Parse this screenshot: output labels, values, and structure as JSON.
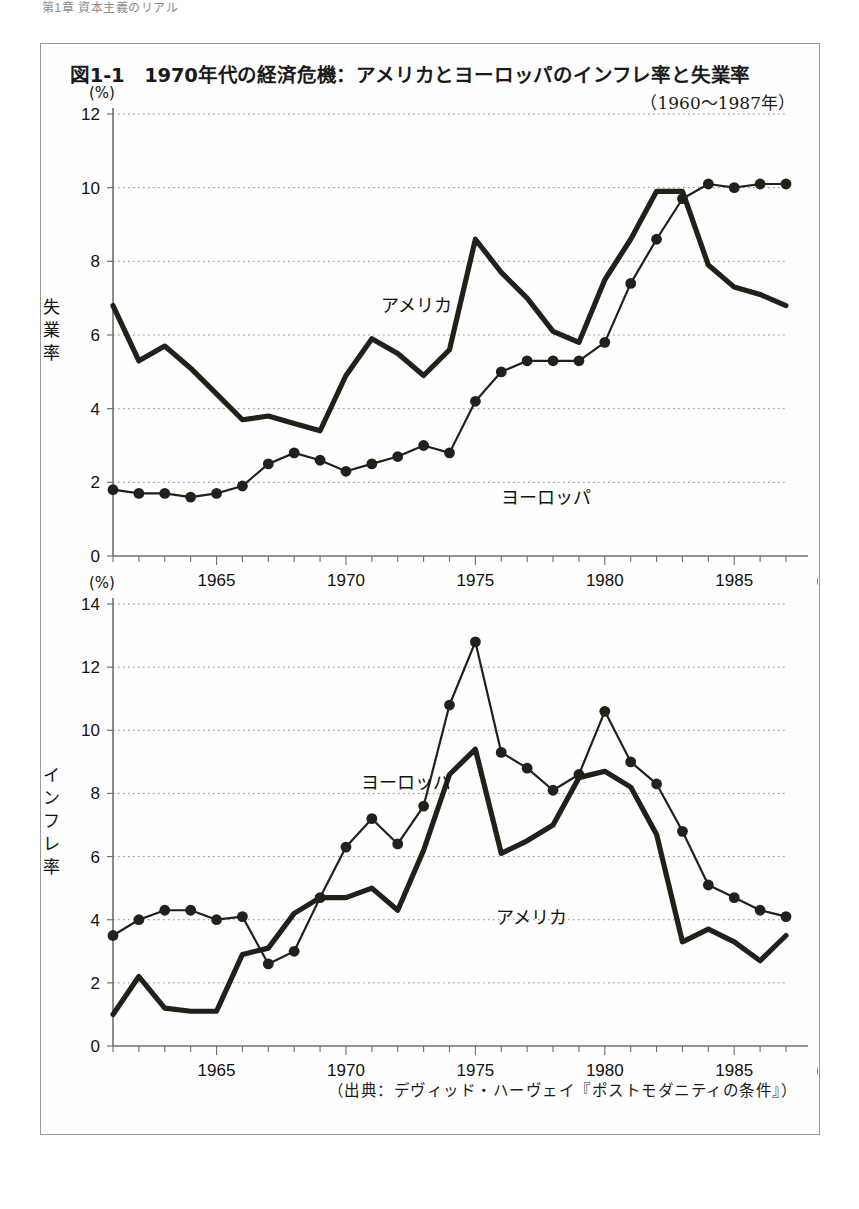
{
  "page": {
    "header_text": "第1章 資本主義のリアル"
  },
  "figure": {
    "title": "図1-1　1970年代の経済危機：アメリカとヨーロッパのインフレ率と失業率",
    "subtitle": "（1960〜1987年）",
    "source": "（出典：デヴィッド・ハーヴェイ『ポストモダニティの条件』）",
    "unit_label": "(%)",
    "year_unit_label": "(年)",
    "series_label_america": "アメリカ",
    "series_label_europe": "ヨーロッパ"
  },
  "chart_data": [
    {
      "type": "line",
      "title": "失業率",
      "ylabel": "失業率",
      "xlabel": "(年)",
      "unit": "(%)",
      "ylim": [
        0,
        12
      ],
      "yticks": [
        0,
        2,
        4,
        6,
        8,
        10,
        12
      ],
      "xlim": [
        1961,
        1987
      ],
      "xticks": [
        1965,
        1970,
        1975,
        1980,
        1985
      ],
      "grid": true,
      "legend": "inline-annotation",
      "x": [
        1961,
        1962,
        1963,
        1964,
        1965,
        1966,
        1967,
        1968,
        1969,
        1970,
        1971,
        1972,
        1973,
        1974,
        1975,
        1976,
        1977,
        1978,
        1979,
        1980,
        1981,
        1982,
        1983,
        1984,
        1985,
        1986,
        1987
      ],
      "series": [
        {
          "name": "アメリカ",
          "marker": false,
          "values": [
            6.8,
            5.3,
            5.7,
            5.1,
            4.4,
            3.7,
            3.8,
            3.6,
            3.4,
            4.9,
            5.9,
            5.5,
            4.9,
            5.6,
            8.6,
            7.7,
            7.0,
            6.1,
            5.8,
            7.5,
            8.6,
            9.9,
            9.9,
            7.9,
            7.3,
            7.1,
            6.8
          ]
        },
        {
          "name": "ヨーロッパ",
          "marker": true,
          "values": [
            1.8,
            1.7,
            1.7,
            1.6,
            1.7,
            1.9,
            2.5,
            2.8,
            2.6,
            2.3,
            2.5,
            2.7,
            3.0,
            2.8,
            4.2,
            5.0,
            5.3,
            5.3,
            5.3,
            5.8,
            7.4,
            8.6,
            9.7,
            10.1,
            10.0,
            10.1,
            10.1
          ]
        }
      ]
    },
    {
      "type": "line",
      "title": "インフレ率",
      "ylabel": "インフレ率",
      "xlabel": "(年)",
      "unit": "(%)",
      "ylim": [
        0,
        14
      ],
      "yticks": [
        0,
        2,
        4,
        6,
        8,
        10,
        12,
        14
      ],
      "xlim": [
        1961,
        1987
      ],
      "xticks": [
        1965,
        1970,
        1975,
        1980,
        1985
      ],
      "grid": true,
      "legend": "inline-annotation",
      "x": [
        1961,
        1962,
        1963,
        1964,
        1965,
        1966,
        1967,
        1968,
        1969,
        1970,
        1971,
        1972,
        1973,
        1974,
        1975,
        1976,
        1977,
        1978,
        1979,
        1980,
        1981,
        1982,
        1983,
        1984,
        1985,
        1986,
        1987
      ],
      "series": [
        {
          "name": "アメリカ",
          "marker": false,
          "values": [
            1.0,
            2.2,
            1.2,
            1.1,
            1.1,
            2.9,
            3.1,
            4.2,
            4.7,
            4.7,
            5.0,
            4.3,
            6.2,
            8.6,
            9.4,
            6.1,
            6.5,
            7.0,
            8.5,
            8.7,
            8.2,
            6.7,
            3.3,
            3.7,
            3.3,
            2.7,
            3.5
          ]
        },
        {
          "name": "ヨーロッパ",
          "marker": true,
          "values": [
            3.5,
            4.0,
            4.3,
            4.3,
            4.0,
            4.1,
            2.6,
            3.0,
            4.7,
            6.3,
            7.2,
            6.4,
            7.6,
            10.8,
            12.8,
            9.3,
            8.8,
            8.1,
            8.6,
            10.6,
            9.0,
            8.3,
            6.8,
            5.1,
            4.7,
            4.3,
            4.1
          ]
        }
      ]
    }
  ]
}
